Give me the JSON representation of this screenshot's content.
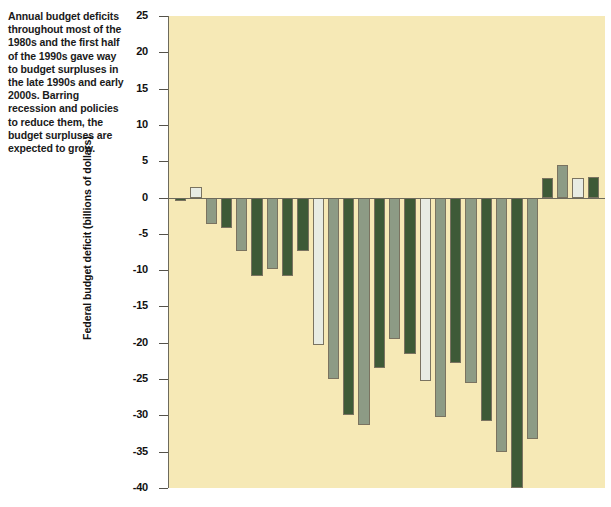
{
  "caption": {
    "text": "Annual budget deficits throughout most of the 1980s and the first half of the 1990s gave way to budget surpluses in the late 1990s and early 2000s. Barring recession and policies to reduce them, the budget surpluses are expected to grow."
  },
  "axis": {
    "ylabel": "Federal budget deficit (billions of dollars)"
  },
  "colors": {
    "plot_background": "#f6e9b6",
    "dark_green": "#3e5a37",
    "sage_green": "#8d9b85",
    "light_gray": "#e8ece3",
    "axis": "#6d6a5c",
    "bar_outline": "#7a7360",
    "text": "#111111"
  },
  "chart_data": {
    "type": "bar",
    "title": "",
    "xlabel": "",
    "ylabel": "Federal budget deficit (billions of dollars)",
    "ylim": [
      -40,
      25
    ],
    "yticks": [
      25,
      20,
      15,
      10,
      5,
      0,
      -5,
      -10,
      -15,
      -20,
      -25,
      -30,
      -35,
      -40
    ],
    "ytick_labels": [
      "25",
      "20",
      "15",
      "10",
      "5",
      "0",
      "-5",
      "-10",
      "-15",
      "-20",
      "-25",
      "-30",
      "-35",
      "-40"
    ],
    "grid": false,
    "legend": null,
    "categories": [
      "1973",
      "74",
      "75",
      "76",
      "77",
      "78",
      "79",
      "80",
      "81",
      "82",
      "83",
      "84",
      "85",
      "86",
      "87",
      "88",
      "89",
      "90",
      "91",
      "92",
      "93",
      "94",
      "95",
      "96",
      "97",
      "98",
      "99",
      "2000"
    ],
    "values": [
      -0.5,
      1.5,
      -3.6,
      -4.2,
      -7.3,
      -10.8,
      -9.8,
      -10.8,
      -7.3,
      -20.3,
      -25.0,
      -30.0,
      -31.3,
      -23.5,
      -19.5,
      -21.5,
      -25.3,
      -30.2,
      -22.8,
      -25.5,
      -30.8,
      -35.0,
      -40.0,
      -33.3,
      2.7,
      4.5,
      2.7,
      2.8
    ],
    "bar_colors": [
      "dark_green",
      "light_gray",
      "sage_green",
      "dark_green",
      "sage_green",
      "dark_green",
      "sage_green",
      "dark_green",
      "dark_green",
      "light_gray",
      "sage_green",
      "dark_green",
      "sage_green",
      "dark_green",
      "sage_green",
      "dark_green",
      "light_gray",
      "sage_green",
      "dark_green",
      "sage_green",
      "dark_green",
      "sage_green",
      "dark_green",
      "sage_green",
      "dark_green",
      "sage_green",
      "light_gray",
      "dark_green"
    ]
  }
}
